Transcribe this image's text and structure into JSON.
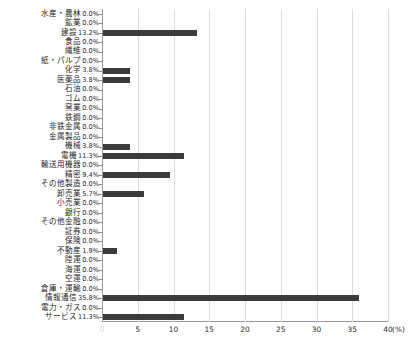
{
  "top_caption": "",
  "axis": {
    "unit_label": "(%)",
    "xticks": [
      0,
      5,
      10,
      15,
      20,
      25,
      30,
      35,
      40
    ],
    "xtick_labels": [
      "0",
      "5",
      "10",
      "15",
      "20",
      "25",
      "30",
      "35",
      "40"
    ]
  },
  "style": {
    "bar_color": "#3b3b3b",
    "grid_color": "#dcdcdc",
    "axis_color": "#9a9a9a"
  },
  "chart_data": {
    "type": "bar",
    "orientation": "horizontal",
    "title": "",
    "xlabel": "(%)",
    "ylabel": "",
    "xlim": [
      0,
      40
    ],
    "grid": true,
    "legend": false,
    "categories": [
      "水産・農林",
      "鉱業",
      "建設",
      "食品",
      "繊維",
      "紙・パルプ",
      "化学",
      "医薬品",
      "石油",
      "ゴム",
      "窯業",
      "鉄鋼",
      "非鉄金属",
      "金属製品",
      "機械",
      "電機",
      "輸送用機器",
      "精密",
      "その他製造",
      "卸売業",
      "小売業",
      "銀行",
      "その他金融",
      "証券",
      "保険",
      "不動産",
      "陸運",
      "海運",
      "空運",
      "倉庫・運輸",
      "情報通信",
      "電力・ガス",
      "サービス"
    ],
    "values": [
      0.0,
      0.0,
      13.2,
      0.0,
      0.0,
      0.0,
      3.8,
      3.8,
      0.0,
      0.0,
      0.0,
      0.0,
      0.0,
      0.0,
      3.8,
      11.3,
      0.0,
      9.4,
      0.0,
      5.7,
      0.0,
      0.0,
      0.0,
      0.0,
      0.0,
      1.9,
      0.0,
      0.0,
      0.0,
      0.0,
      35.8,
      0.0,
      11.3
    ],
    "value_labels": [
      "0.0%",
      "0.0%",
      "13.2%",
      "0.0%",
      "0.0%",
      "0.0%",
      "3.8%",
      "3.8%",
      "0.0%",
      "0.0%",
      "0.0%",
      "0.0%",
      "0.0%",
      "0.0%",
      "3.8%",
      "11.3%",
      "0.0%",
      "9.4%",
      "0.0%",
      "5.7%",
      "0.0%",
      "0.0%",
      "0.0%",
      "0.0%",
      "0.0%",
      "1.9%",
      "0.0%",
      "0.0%",
      "0.0%",
      "0.0%",
      "35.8%",
      "0.0%",
      "11.3%"
    ]
  }
}
